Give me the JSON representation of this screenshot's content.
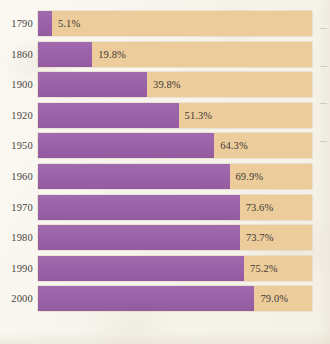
{
  "chart_data": {
    "type": "bar",
    "orientation": "horizontal",
    "stacked": true,
    "title": "",
    "subtitle": "",
    "xlabel": "",
    "ylabel": "",
    "xlim": [
      0,
      100
    ],
    "grid": false,
    "legend": "none",
    "categories": [
      "1790",
      "1860",
      "1900",
      "1920",
      "1950",
      "1960",
      "1970",
      "1980",
      "1990",
      "2000"
    ],
    "values": [
      5.1,
      19.8,
      39.8,
      51.3,
      64.3,
      69.9,
      73.6,
      73.7,
      75.2,
      79.0
    ],
    "value_labels": [
      "5.1%",
      "19.8%",
      "39.8%",
      "51.3%",
      "64.3%",
      "69.9%",
      "73.6%",
      "73.7%",
      "75.2%",
      "79.0%"
    ],
    "series": [
      {
        "name": "filled",
        "color": "#9b5fa8",
        "values": [
          5.1,
          19.8,
          39.8,
          51.3,
          64.3,
          69.9,
          73.6,
          73.7,
          75.2,
          79.0
        ]
      },
      {
        "name": "remainder",
        "color": "#ebcc9a",
        "values": [
          94.9,
          80.2,
          60.2,
          48.7,
          35.7,
          30.1,
          26.4,
          26.3,
          24.8,
          21.0
        ]
      }
    ]
  },
  "rows": [
    {
      "year": "1790",
      "value": 5.1,
      "label": "5.1%"
    },
    {
      "year": "1860",
      "value": 19.8,
      "label": "19.8%"
    },
    {
      "year": "1900",
      "value": 39.8,
      "label": "39.8%"
    },
    {
      "year": "1920",
      "value": 51.3,
      "label": "51.3%"
    },
    {
      "year": "1950",
      "value": 64.3,
      "label": "64.3%"
    },
    {
      "year": "1960",
      "value": 69.9,
      "label": "69.9%"
    },
    {
      "year": "1970",
      "value": 73.6,
      "label": "73.6%"
    },
    {
      "year": "1980",
      "value": 73.7,
      "label": "73.7%"
    },
    {
      "year": "1990",
      "value": 75.2,
      "label": "75.2%"
    },
    {
      "year": "2000",
      "value": 79.0,
      "label": "79.0%"
    }
  ],
  "colors": {
    "fill": "#9b5fa8",
    "track": "#ebcc9a",
    "background": "#f7f4ec",
    "text": "#4a4340"
  },
  "layout": {
    "track_left": 38,
    "track_width": 274,
    "row_height": 25,
    "row_pitch": 30.6,
    "first_row_top": 11,
    "label_gap": 6
  }
}
